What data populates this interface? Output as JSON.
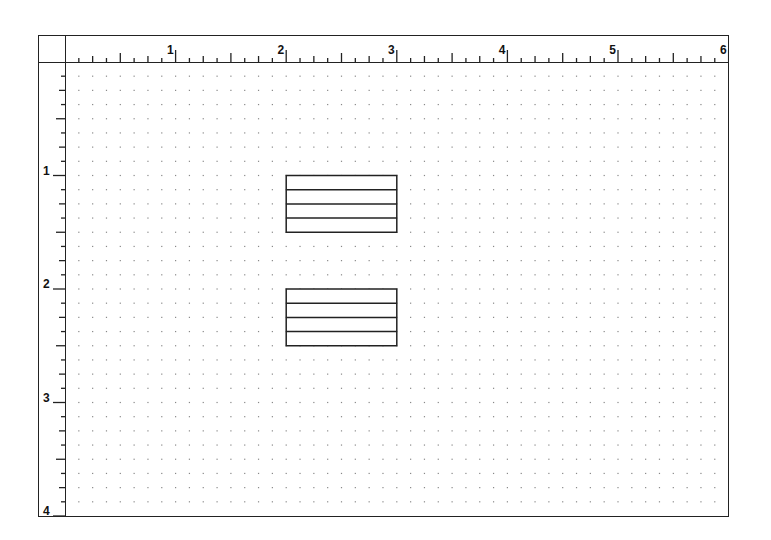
{
  "ruler": {
    "unit": "inch",
    "subdivisions": 8,
    "horizontal_labels": [
      "1",
      "2",
      "3",
      "4",
      "5",
      "6"
    ],
    "vertical_labels": [
      "1",
      "2",
      "3",
      "4"
    ]
  },
  "grid": {
    "type": "dot-grid",
    "spacing": "1/8 inch",
    "width_in": 6,
    "height_in": 4
  },
  "objects": [
    {
      "name": "table-box-1",
      "x_in": 2.0,
      "y_in": 1.0,
      "w_in": 1.0,
      "h_in": 0.5,
      "rows": 4
    },
    {
      "name": "table-box-2",
      "x_in": 2.0,
      "y_in": 2.0,
      "w_in": 1.0,
      "h_in": 0.5,
      "rows": 4
    }
  ],
  "colors": {
    "line": "#222222",
    "dot": "#888888",
    "background": "#ffffff"
  }
}
